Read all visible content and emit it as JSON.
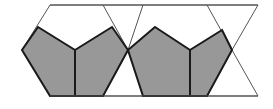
{
  "figure": {
    "name": "pentagon-hexagon-tiling-strip",
    "width": 273,
    "height": 109,
    "background_color": "#ffffff",
    "shaded_fill_color": "#989898",
    "white_fill_color": "#ffffff",
    "stroke_color": "#1a1a1a",
    "thin_stroke_color": "#555555",
    "thick_stroke_width": 2,
    "thin_stroke_width": 1,
    "labels": [],
    "annotations": []
  },
  "geometry": {
    "strip": {
      "top_y": 5,
      "bottom_y": 96,
      "left_x": 0,
      "right_x": 273
    },
    "top_vertices_x": [
      50,
      103,
      143,
      207,
      258
    ],
    "bottom_vertices_x": [
      50,
      103,
      143,
      207,
      258
    ],
    "side_vertices": [
      {
        "x": 22,
        "y": 50
      },
      {
        "x": 128,
        "y": 50
      },
      {
        "x": 232,
        "y": 50
      }
    ],
    "hexagons": [
      {
        "name": "hexagon-left",
        "points": "50,5 103,5 128,50 103,96 50,96 22,50"
      },
      {
        "name": "hexagon-right",
        "points": "143,5 207,5 232,50 207,96 143,96 128,50"
      }
    ],
    "shaded_pentagons": [
      {
        "name": "pentagon-left-outer",
        "points": "38,27 75,50 75,96 50,96 22,50"
      },
      {
        "name": "pentagon-left-inner",
        "points": "112,27 75,50 75,96 103,96 128,50"
      },
      {
        "name": "pentagon-right-outer",
        "points": "155,27 190,50 190,96 143,96 128,50"
      },
      {
        "name": "pentagon-right-inner",
        "points": "222,30 190,50 190,96 207,96 232,50"
      }
    ],
    "white_notches": [
      {
        "name": "notch-left",
        "points": "38,27 112,27 75,50"
      },
      {
        "name": "notch-right",
        "points": "155,27 222,30 190,50"
      }
    ],
    "white_triangles": [
      {
        "name": "triangle-far-left-top",
        "points": "50,5 22,50 38,27"
      },
      {
        "name": "triangle-between-top",
        "points": "103,5 143,5 128,50"
      },
      {
        "name": "triangle-between-bottom",
        "points": "103,96 143,96 128,50"
      },
      {
        "name": "triangle-far-right-top",
        "points": "207,5 258,5 232,50"
      },
      {
        "name": "triangle-far-right-bottom",
        "points": "207,96 258,96 232,50"
      }
    ],
    "dividers": [
      {
        "name": "divider-left",
        "x": 75,
        "y1": 50,
        "y2": 96
      },
      {
        "name": "divider-right",
        "x": 190,
        "y1": 50,
        "y2": 96
      }
    ]
  }
}
